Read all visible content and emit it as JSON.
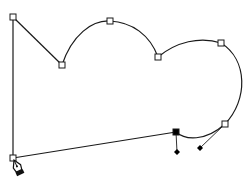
{
  "canvas": {
    "width": 250,
    "height": 182,
    "background": "#ffffff"
  },
  "path": {
    "stroke": "#1a1a1a",
    "segments": [
      {
        "type": "line",
        "from": [
          13,
          17
        ],
        "to": [
          62,
          65
        ]
      },
      {
        "type": "curve",
        "from": [
          62,
          65
        ],
        "c1": [
          72,
          35
        ],
        "c2": [
          92,
          20
        ],
        "to": [
          110,
          21
        ]
      },
      {
        "type": "curve",
        "from": [
          110,
          21
        ],
        "c1": [
          132,
          22
        ],
        "c2": [
          150,
          35
        ],
        "to": [
          158,
          57
        ]
      },
      {
        "type": "curve",
        "from": [
          158,
          57
        ],
        "c1": [
          176,
          42
        ],
        "c2": [
          200,
          36
        ],
        "to": [
          221,
          43
        ]
      },
      {
        "type": "curve",
        "from": [
          221,
          43
        ],
        "c1": [
          248,
          60
        ],
        "c2": [
          248,
          100
        ],
        "to": [
          225,
          124
        ]
      },
      {
        "type": "curve",
        "from": [
          225,
          124
        ],
        "c1": [
          205,
          142
        ],
        "c2": [
          185,
          140
        ],
        "to": [
          176,
          132
        ]
      },
      {
        "type": "line",
        "from": [
          176,
          132
        ],
        "to": [
          13,
          158
        ]
      },
      {
        "type": "line",
        "from": [
          13,
          158
        ],
        "to": [
          13,
          17
        ]
      }
    ]
  },
  "anchors": [
    {
      "x": 13,
      "y": 17,
      "selected": false
    },
    {
      "x": 62,
      "y": 65,
      "selected": false
    },
    {
      "x": 110,
      "y": 21,
      "selected": false
    },
    {
      "x": 158,
      "y": 57,
      "selected": false
    },
    {
      "x": 221,
      "y": 43,
      "selected": false
    },
    {
      "x": 225,
      "y": 124,
      "selected": false
    },
    {
      "x": 176,
      "y": 132,
      "selected": true
    },
    {
      "x": 13,
      "y": 158,
      "selected": false
    }
  ],
  "handles": [
    {
      "from": [
        176,
        132
      ],
      "to": [
        177,
        152
      ]
    },
    {
      "from": [
        225,
        124
      ],
      "to": [
        200,
        148
      ]
    }
  ],
  "cursor": {
    "icon": "pen-tool-icon",
    "x": 14,
    "y": 160
  }
}
